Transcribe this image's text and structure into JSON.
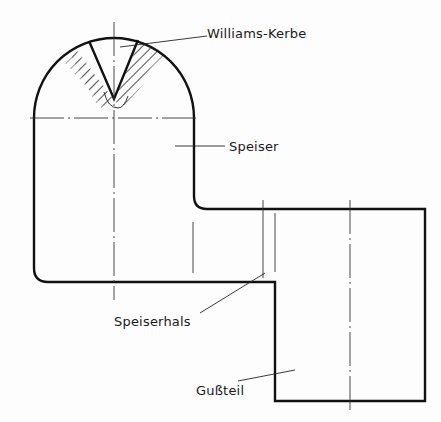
{
  "diagram": {
    "type": "technical-drawing",
    "labels": {
      "williams_kerbe": "Williams-Kerbe",
      "speiser": "Speiser",
      "speiserhals": "Speiserhals",
      "gussteil": "Gußteil"
    },
    "colors": {
      "line": "#111111",
      "background": "#fdfdfd"
    }
  }
}
